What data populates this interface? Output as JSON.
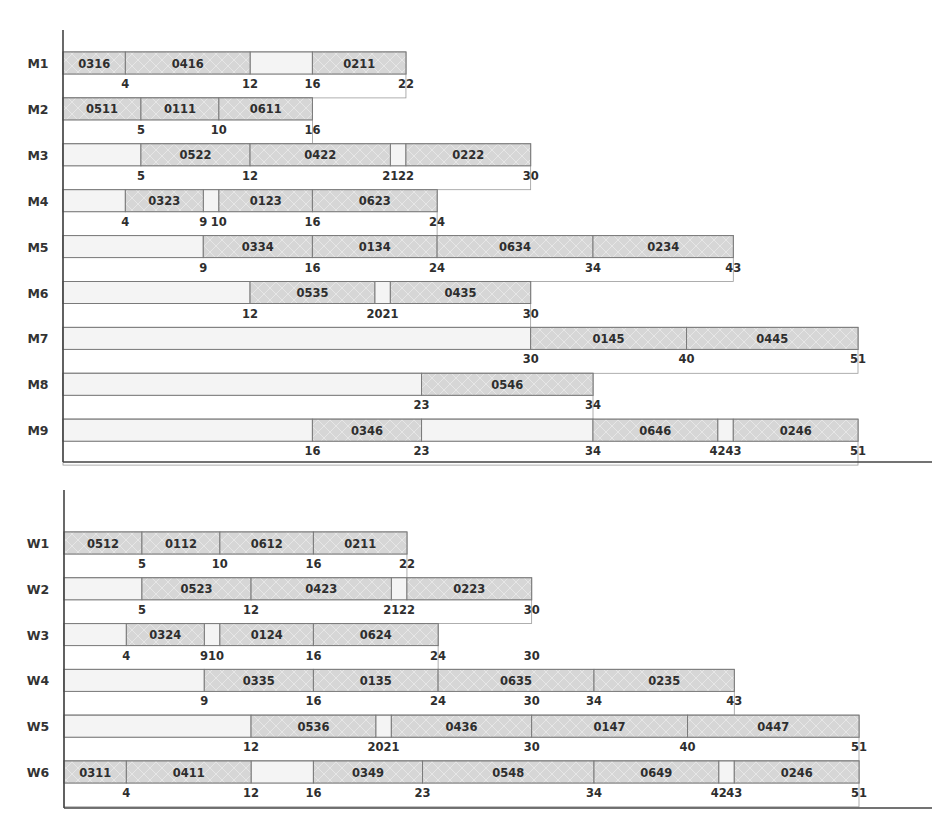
{
  "chart_data": [
    {
      "type": "gantt",
      "title": "",
      "xlabel": "",
      "ylabel": "",
      "xlim": [
        0,
        51
      ],
      "grid": false,
      "legend": "none",
      "colors": {
        "operation_fill": "#d6d6d6",
        "idle_fill": "#f4f4f4",
        "outline": "#7a7a7a",
        "axis": "#444444",
        "text": "#2e2e2e"
      },
      "rows": [
        {
          "label": "M1",
          "ops": [
            {
              "job": "0316",
              "start": 0,
              "end": 4
            },
            {
              "job": "0416",
              "start": 4,
              "end": 12
            },
            {
              "job": "0211",
              "start": 16,
              "end": 22
            }
          ],
          "tick_labels": [
            "4",
            "12",
            "16",
            "22"
          ]
        },
        {
          "label": "M2",
          "ops": [
            {
              "job": "0511",
              "start": 0,
              "end": 5
            },
            {
              "job": "0111",
              "start": 5,
              "end": 10
            },
            {
              "job": "0611",
              "start": 10,
              "end": 16
            }
          ],
          "tick_labels": [
            "5",
            "10",
            "16"
          ]
        },
        {
          "label": "M3",
          "ops": [
            {
              "job": "0522",
              "start": 5,
              "end": 12
            },
            {
              "job": "0422",
              "start": 12,
              "end": 21
            },
            {
              "job": "0222",
              "start": 22,
              "end": 30
            }
          ],
          "tick_labels": [
            "5",
            "12",
            "21",
            "22",
            "30"
          ]
        },
        {
          "label": "M4",
          "ops": [
            {
              "job": "0323",
              "start": 4,
              "end": 9
            },
            {
              "job": "0123",
              "start": 10,
              "end": 16
            },
            {
              "job": "0623",
              "start": 16,
              "end": 24
            }
          ],
          "tick_labels": [
            "4",
            "9",
            "10",
            "16",
            "24"
          ]
        },
        {
          "label": "M5",
          "ops": [
            {
              "job": "0334",
              "start": 9,
              "end": 16
            },
            {
              "job": "0134",
              "start": 16,
              "end": 24
            },
            {
              "job": "0634",
              "start": 24,
              "end": 34
            },
            {
              "job": "0234",
              "start": 34,
              "end": 43
            }
          ],
          "tick_labels": [
            "9",
            "16",
            "24",
            "34",
            "43"
          ]
        },
        {
          "label": "M6",
          "ops": [
            {
              "job": "0535",
              "start": 12,
              "end": 20
            },
            {
              "job": "0435",
              "start": 21,
              "end": 30
            }
          ],
          "tick_labels": [
            "12",
            "2021",
            "30"
          ]
        },
        {
          "label": "M7",
          "ops": [
            {
              "job": "0145",
              "start": 30,
              "end": 40
            },
            {
              "job": "0445",
              "start": 40,
              "end": 51
            }
          ],
          "tick_labels": [
            "30",
            "40",
            "51"
          ]
        },
        {
          "label": "M8",
          "ops": [
            {
              "job": "0546",
              "start": 23,
              "end": 34
            }
          ],
          "tick_labels": [
            "23",
            "34"
          ]
        },
        {
          "label": "M9",
          "ops": [
            {
              "job": "0346",
              "start": 16,
              "end": 23
            },
            {
              "job": "0646",
              "start": 34,
              "end": 42
            },
            {
              "job": "0246",
              "start": 43,
              "end": 51
            }
          ],
          "tick_labels": [
            "16",
            "23",
            "34",
            "4243",
            "51"
          ]
        }
      ]
    },
    {
      "type": "gantt",
      "title": "",
      "xlabel": "",
      "ylabel": "",
      "xlim": [
        0,
        51
      ],
      "grid": false,
      "legend": "none",
      "colors": {
        "operation_fill": "#d6d6d6",
        "idle_fill": "#f4f4f4",
        "outline": "#7a7a7a",
        "axis": "#444444",
        "text": "#2e2e2e"
      },
      "rows": [
        {
          "label": "W1",
          "ops": [
            {
              "job": "0512",
              "start": 0,
              "end": 5
            },
            {
              "job": "0112",
              "start": 5,
              "end": 10
            },
            {
              "job": "0612",
              "start": 10,
              "end": 16
            },
            {
              "job": "0211",
              "start": 16,
              "end": 22
            }
          ],
          "tick_labels": [
            "5",
            "10",
            "16",
            "22"
          ]
        },
        {
          "label": "W2",
          "ops": [
            {
              "job": "0523",
              "start": 5,
              "end": 12
            },
            {
              "job": "0423",
              "start": 12,
              "end": 21
            },
            {
              "job": "0223",
              "start": 22,
              "end": 30
            }
          ],
          "tick_labels": [
            "5",
            "12",
            "21",
            "22",
            "30"
          ]
        },
        {
          "label": "W3",
          "ops": [
            {
              "job": "0324",
              "start": 4,
              "end": 9
            },
            {
              "job": "0124",
              "start": 10,
              "end": 16
            },
            {
              "job": "0624",
              "start": 16,
              "end": 24
            }
          ],
          "tick_labels": [
            "4",
            "910",
            "16",
            "24",
            "30"
          ]
        },
        {
          "label": "W4",
          "ops": [
            {
              "job": "0335",
              "start": 9,
              "end": 16
            },
            {
              "job": "0135",
              "start": 16,
              "end": 24
            },
            {
              "job": "0635",
              "start": 24,
              "end": 34
            },
            {
              "job": "0235",
              "start": 34,
              "end": 43
            }
          ],
          "tick_labels": [
            "9",
            "16",
            "24",
            "30",
            "34",
            "43"
          ]
        },
        {
          "label": "W5",
          "ops": [
            {
              "job": "0536",
              "start": 12,
              "end": 20
            },
            {
              "job": "0436",
              "start": 21,
              "end": 30
            },
            {
              "job": "0147",
              "start": 30,
              "end": 40
            },
            {
              "job": "0447",
              "start": 40,
              "end": 51
            }
          ],
          "tick_labels": [
            "12",
            "2021",
            "30",
            "40",
            "51"
          ]
        },
        {
          "label": "W6",
          "ops": [
            {
              "job": "0311",
              "start": 0,
              "end": 4
            },
            {
              "job": "0411",
              "start": 4,
              "end": 12
            },
            {
              "job": "0349",
              "start": 16,
              "end": 23
            },
            {
              "job": "0548",
              "start": 23,
              "end": 34
            },
            {
              "job": "0649",
              "start": 34,
              "end": 42
            },
            {
              "job": "0246",
              "start": 43,
              "end": 51
            }
          ],
          "tick_labels": [
            "4",
            "12",
            "16",
            "23",
            "34",
            "42",
            "43",
            "51"
          ]
        }
      ]
    }
  ]
}
